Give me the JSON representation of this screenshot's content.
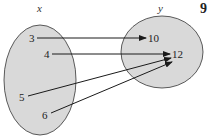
{
  "diagram": {
    "type": "mapping",
    "domain_label": "x",
    "range_label": "y",
    "corner_number": "9",
    "domain": [
      "3",
      "4",
      "5",
      "6"
    ],
    "range": [
      "10",
      "12"
    ],
    "mappings": [
      {
        "from": "3",
        "to": "10"
      },
      {
        "from": "4",
        "to": "12"
      },
      {
        "from": "5",
        "to": "12"
      },
      {
        "from": "6",
        "to": "12"
      }
    ],
    "colors": {
      "set_fill": "#d9d9d9",
      "stroke": "#333333",
      "arrow": "#1a1a1a"
    }
  }
}
